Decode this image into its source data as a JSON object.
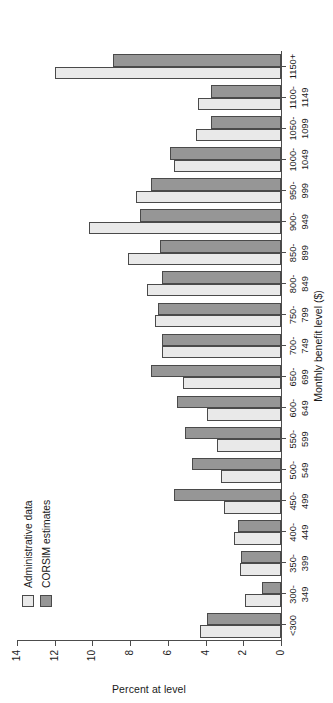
{
  "chart_data": {
    "type": "bar",
    "title": "",
    "xlabel": "Monthly benefit level ($)",
    "ylabel": "Percent at level",
    "ylim": [
      0,
      14
    ],
    "yticks": [
      0,
      2,
      4,
      6,
      8,
      10,
      12,
      14
    ],
    "ytick_labels": [
      "0",
      "2",
      "4",
      "6",
      "8",
      "10",
      "12",
      "14"
    ],
    "grid": false,
    "orientation": "horizontal-bars-rotated",
    "legend_position": "upper-left",
    "categories": [
      "<300",
      "300-349",
      "350-399",
      "400-449",
      "450-499",
      "500-549",
      "550-599",
      "600-649",
      "650-699",
      "700-749",
      "750-799",
      "800-849",
      "850-899",
      "900-949",
      "950-999",
      "1000-1049",
      "1050-1099",
      "1100-1149",
      "1150+"
    ],
    "category_labels": [
      {
        "line1": "<300",
        "line2": ""
      },
      {
        "line1": "300-",
        "line2": "349"
      },
      {
        "line1": "350-",
        "line2": "399"
      },
      {
        "line1": "400-",
        "line2": "449"
      },
      {
        "line1": "450-",
        "line2": "499"
      },
      {
        "line1": "500-",
        "line2": "549"
      },
      {
        "line1": "550-",
        "line2": "599"
      },
      {
        "line1": "600-",
        "line2": "649"
      },
      {
        "line1": "650-",
        "line2": "699"
      },
      {
        "line1": "700-",
        "line2": "749"
      },
      {
        "line1": "750-",
        "line2": "799"
      },
      {
        "line1": "800-",
        "line2": "849"
      },
      {
        "line1": "850-",
        "line2": "899"
      },
      {
        "line1": "900-",
        "line2": "949"
      },
      {
        "line1": "950-",
        "line2": "999"
      },
      {
        "line1": "1000-",
        "line2": "1049"
      },
      {
        "line1": "1050-",
        "line2": "1099"
      },
      {
        "line1": "1100-",
        "line2": "1149"
      },
      {
        "line1": "1150+",
        "line2": ""
      }
    ],
    "series": [
      {
        "name": "Administrative data",
        "color": "#e9e9e9",
        "values": [
          4.3,
          1.9,
          2.2,
          2.5,
          3.0,
          3.2,
          3.4,
          3.9,
          5.2,
          6.3,
          6.7,
          7.1,
          8.1,
          10.2,
          7.7,
          5.7,
          4.5,
          4.4,
          12.0
        ]
      },
      {
        "name": "CORSIM estimates",
        "color": "#969696",
        "values": [
          3.9,
          1.0,
          2.1,
          2.3,
          5.7,
          4.7,
          5.1,
          5.5,
          6.9,
          6.3,
          6.5,
          6.3,
          6.4,
          7.5,
          6.9,
          5.9,
          3.7,
          3.7,
          8.9
        ]
      }
    ]
  },
  "legend": {
    "items": [
      {
        "label": "Administrative data",
        "color": "#e9e9e9"
      },
      {
        "label": "CORSIM estimates",
        "color": "#969696"
      }
    ]
  },
  "axes": {
    "value_axis_title": "Percent at level",
    "category_axis_title": "Monthly benefit level ($)"
  },
  "colors": {
    "admin": "#e9e9e9",
    "corsim": "#969696",
    "axis": "#4c4c4c",
    "bar_outline": "#4a4a4a",
    "text": "#1a1a1a",
    "background": "#ffffff"
  }
}
